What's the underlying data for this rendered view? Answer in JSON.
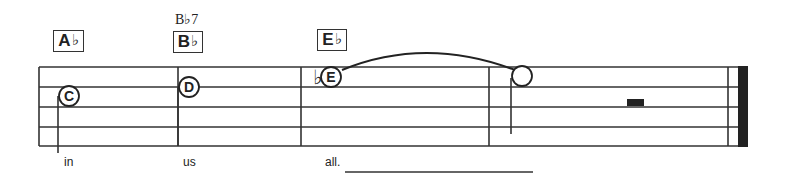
{
  "score": {
    "staff": {
      "lines_y": [
        67,
        87,
        107,
        127,
        146
      ],
      "left_x": 39,
      "right_x": 748,
      "line_color": "#333333"
    },
    "barlines": [
      {
        "x": 39,
        "type": "start"
      },
      {
        "x": 178,
        "type": "single"
      },
      {
        "x": 301,
        "type": "single"
      },
      {
        "x": 489,
        "type": "single"
      },
      {
        "x": 728,
        "type": "final-thin"
      },
      {
        "x": 738,
        "type": "final-thick",
        "width": 10
      }
    ],
    "chords": [
      {
        "name": "Ab",
        "root": "A",
        "accidental": "♭",
        "box": {
          "x": 53,
          "y": 30,
          "w": 31,
          "h": 22
        }
      },
      {
        "name": "Bb",
        "root": "B",
        "accidental": "♭",
        "box": {
          "x": 173,
          "y": 31,
          "w": 30,
          "h": 22
        },
        "alternate": "B♭7"
      },
      {
        "name": "Eb",
        "root": "E",
        "accidental": "♭",
        "box": {
          "x": 317,
          "y": 29,
          "w": 30,
          "h": 22
        }
      }
    ],
    "notes": [
      {
        "letter": "C",
        "cx": 69,
        "cy": 96,
        "r": 10,
        "stem_x": 58,
        "stem_y1": 96,
        "stem_y2": 153,
        "filled_label": true
      },
      {
        "letter": "D",
        "cx": 189,
        "cy": 87,
        "r": 10,
        "stem_x": 178,
        "stem_y1": 87,
        "stem_y2": 146,
        "filled_label": true
      },
      {
        "letter": "E",
        "cx": 331,
        "cy": 77,
        "r": 10,
        "accidental": "♭",
        "accidental_x": 313,
        "accidental_y": 80,
        "filled_label": true
      },
      {
        "letter": "",
        "cx": 522,
        "cy": 76,
        "r": 10,
        "stem_x": 511,
        "stem_y1": 78,
        "stem_y2": 134,
        "filled_label": false
      }
    ],
    "tie": {
      "from": "E",
      "to": "tied-note",
      "start": [
        342,
        70
      ],
      "control": [
        425,
        36
      ],
      "end": [
        515,
        70
      ]
    },
    "rest": {
      "type": "half-rest",
      "x": 627,
      "y": 99,
      "w": 17,
      "h": 7
    },
    "lyrics": [
      {
        "text": "in",
        "x": 64,
        "y": 155
      },
      {
        "text": "us",
        "x": 183,
        "y": 155
      },
      {
        "text": "all.",
        "x": 325,
        "y": 155
      }
    ],
    "extender": {
      "x1": 345,
      "x2": 533,
      "y": 172
    }
  }
}
